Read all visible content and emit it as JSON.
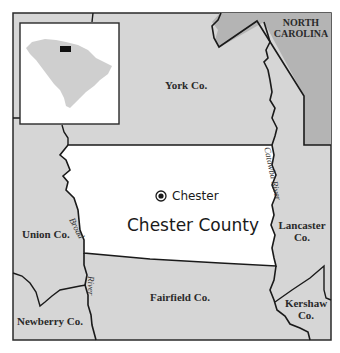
{
  "map": {
    "title": "Chester County",
    "seat": "Chester",
    "colors": {
      "county_fill": "#ffffff",
      "neighbor_fill": "#d6d6d6",
      "nc_fill": "#b4b4b4",
      "border": "#1a1a1a",
      "inset_state": "#cfcfcf",
      "inset_highlight": "#111111"
    },
    "neighbors": {
      "york": "York Co.",
      "union": "Union Co.",
      "lancaster_line1": "Lancaster",
      "lancaster_line2": "Co.",
      "fairfield": "Fairfield Co.",
      "newberry": "Newberry Co.",
      "kershaw_line1": "Kershaw",
      "kershaw_line2": "Co.",
      "nc_line1": "NORTH",
      "nc_line2": "CAROLINA"
    },
    "rivers": {
      "broad_upper": "Broad",
      "broad_lower": "River",
      "catawba": "Catawba River"
    },
    "seat_icon": "circle-dot-icon",
    "inset": {
      "description": "South Carolina locator map with Chester County highlighted"
    }
  }
}
